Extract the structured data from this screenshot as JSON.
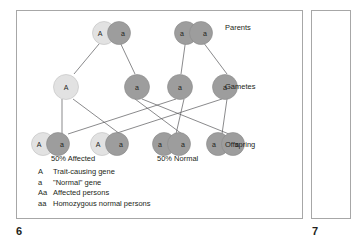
{
  "figure": {
    "page_number_left": "6",
    "page_number_right": "7",
    "colors": {
      "allele_dominant_fill": "#e2e2e2",
      "allele_recessive_fill": "#9d9d9d",
      "line": "#58585a",
      "border": "#a7a7a7",
      "text": "#231f20",
      "background": "#ffffff"
    }
  },
  "rows": [
    {
      "id": "parents",
      "label": "Parents"
    },
    {
      "id": "gametes",
      "label": "Gametes"
    },
    {
      "id": "offspring",
      "label": "Offspring"
    }
  ],
  "parents": [
    {
      "id": "parent-1",
      "left_allele": "A",
      "right_allele": "a",
      "left_shade": "light",
      "right_shade": "dark",
      "genotype": "Aa"
    },
    {
      "id": "parent-2",
      "left_allele": "a",
      "right_allele": "a",
      "left_shade": "dark",
      "right_shade": "dark",
      "genotype": "aa"
    }
  ],
  "gametes": [
    {
      "id": "gamete-1",
      "allele": "A",
      "shade": "light",
      "from": "parent-1"
    },
    {
      "id": "gamete-2",
      "allele": "a",
      "shade": "dark",
      "from": "parent-1"
    },
    {
      "id": "gamete-3",
      "allele": "a",
      "shade": "dark",
      "from": "parent-2"
    },
    {
      "id": "gamete-4",
      "allele": "a",
      "shade": "dark",
      "from": "parent-2"
    }
  ],
  "offspring": [
    {
      "id": "offspring-1",
      "left_allele": "A",
      "right_allele": "a",
      "left_shade": "light",
      "right_shade": "dark",
      "genotype": "Aa",
      "outcome": "Affected"
    },
    {
      "id": "offspring-2",
      "left_allele": "A",
      "right_allele": "a",
      "left_shade": "light",
      "right_shade": "dark",
      "genotype": "Aa",
      "outcome": "Affected"
    },
    {
      "id": "offspring-3",
      "left_allele": "a",
      "right_allele": "a",
      "left_shade": "dark",
      "right_shade": "dark",
      "genotype": "aa",
      "outcome": "Normal"
    },
    {
      "id": "offspring-4",
      "left_allele": "a",
      "right_allele": "a",
      "left_shade": "dark",
      "right_shade": "dark",
      "genotype": "aa",
      "outcome": "Normal"
    }
  ],
  "outcome_labels": [
    {
      "id": "affected",
      "text": "50% Affected"
    },
    {
      "id": "normal",
      "text": "50% Normal"
    }
  ],
  "legend": [
    {
      "symbol": "A",
      "text": "Trait-causing gene"
    },
    {
      "symbol": "a",
      "text": "\"Normal\" gene"
    },
    {
      "symbol": "Aa",
      "text": "Affected persons"
    },
    {
      "symbol": "aa",
      "text": "Homozygous normal persons"
    }
  ]
}
